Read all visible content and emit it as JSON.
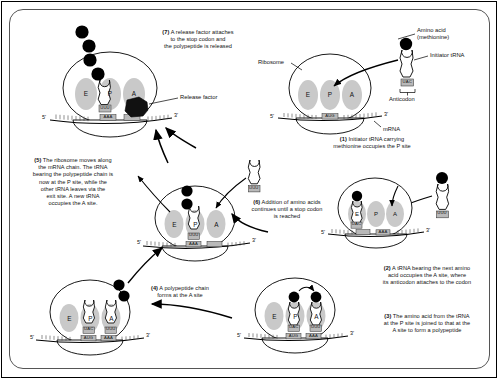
{
  "figure": {
    "background": "#ffffff",
    "line_color": "#000000",
    "subunit_fill": "#c9c9c9",
    "amino_acid_fill": "#000000",
    "release_factor_fill": "#111111"
  },
  "labels": {
    "ribosome": "Ribosome",
    "amino_acid": "Amino acid",
    "amino_acid_paren": "(methionine)",
    "initiator_trna": "Initiator tRNA",
    "anticodon": "Anticodon",
    "mrna": "mRNA",
    "release_factor": "Release factor",
    "five_prime": "5'",
    "three_prime": "3'",
    "site_e": "E",
    "site_p": "P",
    "site_a": "A"
  },
  "codons": {
    "start": "AUG",
    "trna_anticodon_met": "UAC",
    "trna_anticodon_next": "UUU",
    "mrna_next": "AAA"
  },
  "steps": [
    {
      "id": 1,
      "number": "(1)",
      "text": "Initiator tRNA carrying methionine occupies the P site",
      "lines": [
        "Initiator tRNA carrying",
        "methionine occupies the P site"
      ]
    },
    {
      "id": 2,
      "number": "(2)",
      "text": "A tRNA bearing the next amino acid occupies the A site, where its anticodon attaches to the codon",
      "lines": [
        "A tRNA bearing the next amino",
        "acid occupies the A site, where",
        "its anticodon attaches to the codon"
      ]
    },
    {
      "id": 3,
      "number": "(3)",
      "text": "The amino acid from the tRNA at the P site is joined to that at the A site to form a polypeptide",
      "lines": [
        "The amino acid from the tRNA",
        "at the P site is joined to that at the",
        "A site to form a polypeptide"
      ]
    },
    {
      "id": 4,
      "number": "(4)",
      "text": "A polypeptide chain forms at the A site",
      "lines": [
        "A polypeptide chain",
        "forms at the A site"
      ]
    },
    {
      "id": 5,
      "number": "(5)",
      "text": "The ribosome moves along the mRNA chain. The tRNA bearing the polypeptide chain is now at the P site, while the other tRNA leaves via the exit site. A new tRNA occupies the A site.",
      "lines": [
        "The ribosome moves along",
        "the mRNA chain. The tRNA",
        "bearing the polypeptide chain is",
        "now at the P site, while the",
        "other tRNA leaves via the",
        "exit site.  A new tRNA",
        "occupies the A site."
      ]
    },
    {
      "id": 6,
      "number": "(6)",
      "text": "Addition of amino acids continues until a stop codon is reached",
      "lines": [
        "Addition of amino acids",
        "continues until a stop codon",
        "is reached"
      ]
    },
    {
      "id": 7,
      "number": "(7)",
      "text": "A release factor attaches to the stop codon and the polypeptide is released",
      "lines": [
        "A release factor attaches",
        "to the stop codon and",
        "the polypeptide is released"
      ]
    }
  ]
}
